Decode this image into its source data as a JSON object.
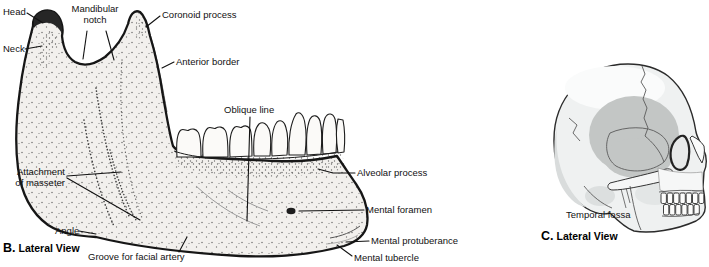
{
  "panel_b": {
    "prefix": "B.",
    "title": "Lateral View",
    "labels": {
      "head": "Head",
      "mandibular_notch": "Mandibular\nnotch",
      "coronoid_process": "Coronoid process",
      "neck": "Neck",
      "anterior_border": "Anterior border",
      "oblique_line": "Oblique line",
      "attachment_of_masseter": "Attachment\nof masseter",
      "angle": "Angle",
      "groove_for_facial_artery": "Groove for facial artery",
      "alveolar_process": "Alveolar process",
      "mental_foramen": "Mental foramen",
      "mental_protuberance": "Mental protuberance",
      "mental_tubercle": "Mental tubercle"
    }
  },
  "panel_c": {
    "prefix": "C.",
    "title": "Lateral View",
    "labels": {
      "temporal_fossa": "Temporal fossa"
    }
  },
  "colors": {
    "outline": "#1a1a1a",
    "bone_fill": "#f2f0ed",
    "stipple": "#4d4d4d",
    "skull_fill": "#eff1f1",
    "skull_shade": "#d9dcdc",
    "temporal_fossa_fill": "#c3c6c5",
    "leader_line": "#111111"
  }
}
